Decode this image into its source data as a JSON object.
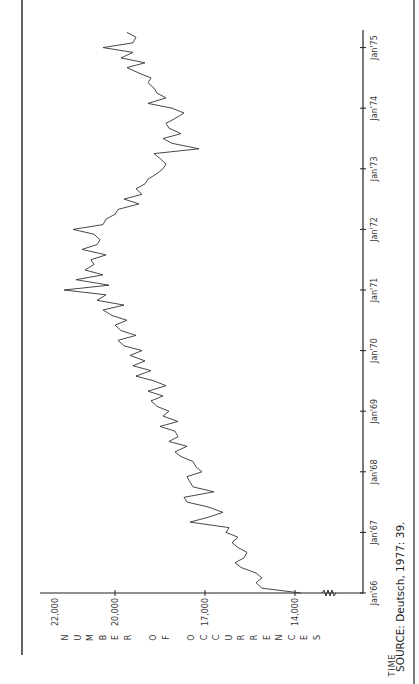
{
  "chart_data": {
    "type": "line",
    "orientation": "rotated-90-ccw",
    "title": "",
    "xlabel": "TIME",
    "ylabel": "NUMBER OF OCCURRENCES",
    "ylim": [
      13000,
      23000
    ],
    "y_ticks": [
      {
        "value": 14000,
        "label": "14,000"
      },
      {
        "value": 17000,
        "label": "17,000"
      },
      {
        "value": 20000,
        "label": "20,000"
      },
      {
        "value": 22000,
        "label": "22,000"
      }
    ],
    "x_ticks": [
      {
        "value": 1966,
        "label": "Jan'66"
      },
      {
        "value": 1967,
        "label": "Jan'67"
      },
      {
        "value": 1968,
        "label": "Jan'68"
      },
      {
        "value": 1969,
        "label": "Jan'69"
      },
      {
        "value": 1970,
        "label": "Jan'70"
      },
      {
        "value": 1971,
        "label": "Jan'71"
      },
      {
        "value": 1972,
        "label": "Jan'72"
      },
      {
        "value": 1973,
        "label": "Jan'73"
      },
      {
        "value": 1974,
        "label": "Jan'74"
      },
      {
        "value": 1975,
        "label": "Jan'75"
      }
    ],
    "axis_break": true,
    "grid": false,
    "series": [
      {
        "name": "Occurrences",
        "x": [
          1966.0,
          1966.08,
          1966.17,
          1966.25,
          1966.33,
          1966.42,
          1966.5,
          1966.58,
          1966.67,
          1966.75,
          1966.83,
          1966.92,
          1967.0,
          1967.08,
          1967.17,
          1967.25,
          1967.33,
          1967.42,
          1967.5,
          1967.58,
          1967.67,
          1967.75,
          1967.83,
          1967.92,
          1968.0,
          1968.08,
          1968.17,
          1968.25,
          1968.33,
          1968.42,
          1968.5,
          1968.58,
          1968.67,
          1968.75,
          1968.83,
          1968.92,
          1969.0,
          1969.08,
          1969.17,
          1969.25,
          1969.33,
          1969.42,
          1969.5,
          1969.58,
          1969.67,
          1969.75,
          1969.83,
          1969.92,
          1970.0,
          1970.08,
          1970.17,
          1970.25,
          1970.33,
          1970.42,
          1970.5,
          1970.58,
          1970.67,
          1970.75,
          1970.83,
          1970.92,
          1971.0,
          1971.08,
          1971.17,
          1971.25,
          1971.33,
          1971.42,
          1971.5,
          1971.58,
          1971.67,
          1971.75,
          1971.83,
          1971.92,
          1972.0,
          1972.08,
          1972.17,
          1972.25,
          1972.33,
          1972.42,
          1972.5,
          1972.58,
          1972.67,
          1972.75,
          1972.83,
          1972.92,
          1973.0,
          1973.08,
          1973.17,
          1973.25,
          1973.33,
          1973.42,
          1973.5,
          1973.58,
          1973.67,
          1973.75,
          1973.83,
          1973.92,
          1974.0,
          1974.08,
          1974.17,
          1974.25,
          1974.33,
          1974.42,
          1974.5,
          1974.58,
          1974.67,
          1974.75,
          1974.83,
          1974.92,
          1975.0,
          1975.08,
          1975.17,
          1975.25
        ],
        "values": [
          13800,
          15100,
          15300,
          15100,
          15300,
          15800,
          16000,
          15700,
          15600,
          15900,
          16100,
          15900,
          16300,
          16200,
          17500,
          16900,
          16400,
          16900,
          17600,
          17700,
          16700,
          17400,
          17500,
          17600,
          17100,
          17300,
          17400,
          17800,
          18000,
          17600,
          18200,
          17900,
          18000,
          18500,
          17900,
          18400,
          18200,
          18600,
          18800,
          18400,
          18900,
          18300,
          18700,
          19300,
          18800,
          19400,
          19000,
          19500,
          19100,
          19700,
          19900,
          19300,
          19800,
          20000,
          19600,
          20100,
          20400,
          19700,
          20600,
          20300,
          21700,
          20200,
          21300,
          20400,
          21000,
          20700,
          20800,
          20300,
          21100,
          20600,
          20500,
          20700,
          21400,
          20400,
          20300,
          20000,
          19900,
          19200,
          19700,
          19100,
          19300,
          19000,
          18900,
          18600,
          18400,
          18300,
          18500,
          18700,
          17200,
          18100,
          18400,
          17800,
          18200,
          18300,
          18000,
          17700,
          18100,
          18900,
          18300,
          18600,
          18700,
          18900,
          18800,
          19200,
          19600,
          19000,
          19800,
          19400,
          20400,
          19400,
          19300,
          19600
        ]
      }
    ]
  },
  "labels": {
    "time": "TIME",
    "ylabel_letters": [
      "N",
      "U",
      "M",
      "B",
      "E",
      "R",
      " ",
      "O",
      "F",
      " ",
      "O",
      "C",
      "C",
      "U",
      "R",
      "R",
      "E",
      "N",
      "C",
      "E",
      "S"
    ],
    "source": "SOURCE: Deutsch, 1977: 39."
  }
}
